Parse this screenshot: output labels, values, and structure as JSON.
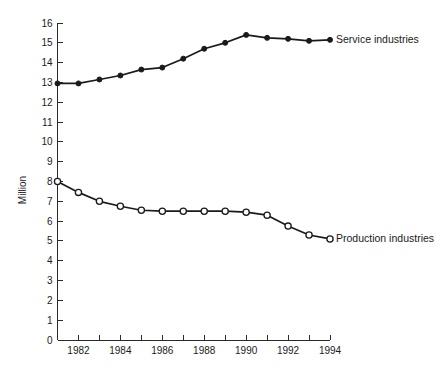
{
  "chart_data": {
    "type": "line",
    "title": "",
    "xlabel": "",
    "ylabel": "Million",
    "xlim": [
      1981,
      1994
    ],
    "ylim": [
      0,
      16
    ],
    "grid": false,
    "legend_position": "inline-right-of-series-end",
    "x": [
      1981,
      1982,
      1983,
      1984,
      1985,
      1986,
      1987,
      1988,
      1989,
      1990,
      1991,
      1992,
      1993,
      1994
    ],
    "x_tick_labels": [
      "",
      "1982",
      "",
      "1984",
      "",
      "1986",
      "",
      "1988",
      "",
      "1990",
      "",
      "1992",
      "",
      "1994"
    ],
    "y_ticks": [
      0,
      1,
      2,
      3,
      4,
      5,
      6,
      7,
      8,
      9,
      10,
      11,
      12,
      13,
      14,
      15,
      16
    ],
    "y_tick_labels": [
      "0",
      "1",
      "2",
      "3",
      "4",
      "5",
      "6",
      "7",
      "8",
      "9",
      "10",
      "11",
      "12",
      "13",
      "14",
      "15",
      "16"
    ],
    "series": [
      {
        "name": "Service industries",
        "marker": "filled-circle",
        "color": "#1a1a1a",
        "values": [
          12.95,
          12.95,
          13.15,
          13.35,
          13.65,
          13.75,
          14.2,
          14.7,
          15.0,
          15.4,
          15.25,
          15.2,
          15.1,
          15.15
        ]
      },
      {
        "name": "Production industries",
        "marker": "open-circle",
        "color": "#1a1a1a",
        "values": [
          8.0,
          7.45,
          7.0,
          6.75,
          6.55,
          6.5,
          6.5,
          6.5,
          6.5,
          6.45,
          6.3,
          5.75,
          5.3,
          5.1
        ]
      }
    ],
    "annotations": [
      {
        "text": "Service industries",
        "anchor_x": 1994,
        "anchor_y": 15.15
      },
      {
        "text": "Production industries",
        "anchor_x": 1994,
        "anchor_y": 5.1
      }
    ]
  }
}
